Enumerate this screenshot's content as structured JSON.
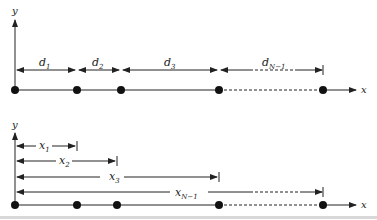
{
  "diagram": {
    "top_panel": {
      "y_axis_label": "y",
      "x_axis_label": "x",
      "segments": [
        {
          "base": "d",
          "sub": "1"
        },
        {
          "base": "d",
          "sub": "2"
        },
        {
          "base": "d",
          "sub": "3"
        },
        {
          "base": "d",
          "sub": "N−1"
        }
      ],
      "point_count_shown": 5
    },
    "bottom_panel": {
      "y_axis_label": "y",
      "x_axis_label": "x",
      "distances": [
        {
          "base": "x",
          "sub": "1"
        },
        {
          "base": "x",
          "sub": "2"
        },
        {
          "base": "x",
          "sub": "3"
        },
        {
          "base": "x",
          "sub": "N−1"
        }
      ],
      "point_count_shown": 5
    },
    "colors": {
      "line": "#222222",
      "background": "#ffffff"
    }
  }
}
